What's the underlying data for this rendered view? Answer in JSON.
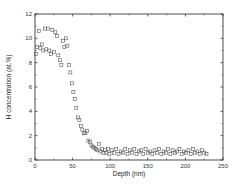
{
  "chart_data": {
    "type": "scatter",
    "title": "",
    "xlabel": "Depth (nm)",
    "ylabel": "H concentration (at.%)",
    "xlim": [
      0,
      250
    ],
    "ylim": [
      0,
      12
    ],
    "xticks": [
      0,
      50,
      100,
      150,
      200,
      250
    ],
    "yticks": [
      0,
      2,
      4,
      6,
      8,
      10,
      12
    ],
    "grid": false,
    "legend": null,
    "marker": "open-square",
    "series": [
      {
        "name": "H concentration",
        "x": [
          1,
          3,
          5,
          7,
          9,
          11,
          13,
          15,
          17,
          19,
          21,
          23,
          25,
          27,
          29,
          31,
          33,
          35,
          37,
          39,
          41,
          43,
          45,
          47,
          49,
          51,
          53,
          55,
          57,
          59,
          61,
          63,
          65,
          67,
          69,
          71,
          73,
          75,
          77,
          79,
          81,
          83,
          85,
          87,
          89,
          91,
          93,
          95,
          97,
          99,
          102,
          105,
          108,
          111,
          114,
          117,
          120,
          123,
          126,
          129,
          132,
          135,
          138,
          141,
          144,
          147,
          150,
          153,
          156,
          159,
          162,
          165,
          168,
          171,
          174,
          177,
          180,
          183,
          186,
          189,
          192,
          195,
          198,
          201,
          204,
          207,
          210,
          213,
          216,
          219,
          222,
          225,
          228
        ],
        "y": [
          8.7,
          9.3,
          10.6,
          9.2,
          9.5,
          9.0,
          10.8,
          9.1,
          10.8,
          9.0,
          8.7,
          10.7,
          8.9,
          10.5,
          10.2,
          8.6,
          8.2,
          7.8,
          9.8,
          9.3,
          10.0,
          9.4,
          7.8,
          7.2,
          6.3,
          5.6,
          5.0,
          4.3,
          3.5,
          3.3,
          2.8,
          2.5,
          2.2,
          2.2,
          2.4,
          1.6,
          1.5,
          1.2,
          1.1,
          1.0,
          0.9,
          0.8,
          1.3,
          0.7,
          0.9,
          0.6,
          0.8,
          0.6,
          0.9,
          0.5,
          0.8,
          0.6,
          0.9,
          0.5,
          0.7,
          0.6,
          0.9,
          0.5,
          0.8,
          0.6,
          0.9,
          0.5,
          0.7,
          0.8,
          0.5,
          0.9,
          0.6,
          0.7,
          0.5,
          0.8,
          0.6,
          0.9,
          0.5,
          0.7,
          0.6,
          0.9,
          0.5,
          0.8,
          0.6,
          0.7,
          0.9,
          0.5,
          0.7,
          0.6,
          0.8,
          0.5,
          0.9,
          0.6,
          0.7,
          0.5,
          0.8,
          0.6,
          0.5
        ]
      }
    ]
  },
  "axes": {
    "xlabel": "Depth (nm)",
    "ylabel": "H concentration (at.%)",
    "xtick_labels": [
      "0",
      "50",
      "100",
      "150",
      "200",
      "250"
    ],
    "ytick_labels": [
      "0",
      "2",
      "4",
      "6",
      "8",
      "10",
      "12"
    ]
  }
}
